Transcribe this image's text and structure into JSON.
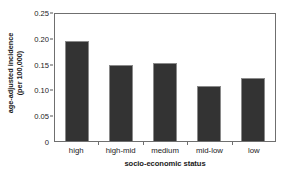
{
  "chart_data": {
    "type": "bar",
    "title": "",
    "xlabel": "socio-economic status",
    "ylabel_line1": "age-adjusted incidence",
    "ylabel_line2": "(per 100,000)",
    "categories": [
      "high",
      "high-mid",
      "medium",
      "mid-low",
      "low"
    ],
    "values": [
      0.196,
      0.149,
      0.153,
      0.108,
      0.125
    ],
    "ylim": [
      0,
      0.25
    ],
    "yticks": [
      0,
      0.05,
      0.1,
      0.15,
      0.2,
      0.25
    ],
    "ytick_labels": [
      "0",
      "0.05",
      "0.10",
      "0.15",
      "0.20",
      "0.25"
    ],
    "grid": false,
    "legend": "none",
    "bar_color": "#333333",
    "frame_color": "#6f6f6f",
    "background": "#ffffff"
  }
}
